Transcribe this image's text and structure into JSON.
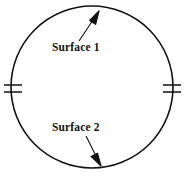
{
  "figure": {
    "background_color": "#ffffff",
    "stroke_color": "#111111"
  },
  "shape": {
    "name": "circle",
    "center_x": 92,
    "center_y": 87,
    "radius": 81,
    "stroke_width": 1.6
  },
  "tick_marks": [
    {
      "name": "left-tick-upper",
      "x1": 4,
      "y1": 85,
      "x2": 22,
      "y2": 85
    },
    {
      "name": "left-tick-lower",
      "x1": 4,
      "y1": 92,
      "x2": 22,
      "y2": 92
    },
    {
      "name": "right-tick-upper",
      "x1": 163,
      "y1": 85,
      "x2": 181,
      "y2": 85
    },
    {
      "name": "right-tick-lower",
      "x1": 163,
      "y1": 92,
      "x2": 181,
      "y2": 92
    }
  ],
  "annotations": [
    {
      "id": "surface-1",
      "label": "Surface 1",
      "label_x": 52,
      "label_y": 51,
      "leader": {
        "from_x": 79,
        "from_y": 41,
        "to_x": 99,
        "to_y": 11
      },
      "arrow_direction": "up-right"
    },
    {
      "id": "surface-2",
      "label": "Surface 2",
      "label_x": 52,
      "label_y": 131,
      "leader": {
        "from_x": 86,
        "from_y": 136,
        "to_x": 101,
        "to_y": 166
      },
      "arrow_direction": "down-right"
    }
  ]
}
